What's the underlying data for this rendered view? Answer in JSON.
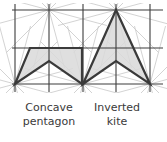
{
  "diagram": {
    "grid": {
      "vertical_x": [
        15,
        49,
        83,
        116,
        150
      ],
      "horizontal_y": [
        10,
        48,
        84
      ],
      "x_min": 12,
      "x_max": 163,
      "y_min": 4,
      "y_max": 92,
      "line_color": "#3c3c3c",
      "guide_color": "#c8c8c8"
    },
    "guide_centers": [
      [
        49,
        10
      ],
      [
        116,
        10
      ],
      [
        15,
        84
      ],
      [
        83,
        84
      ],
      [
        150,
        84
      ]
    ],
    "shapes": [
      {
        "name": "concave-pentagon",
        "points": [
          [
            15,
            84
          ],
          [
            30,
            48
          ],
          [
            82,
            48
          ],
          [
            82,
            84
          ],
          [
            49,
            61
          ]
        ],
        "fill": "#d9d9d9",
        "stroke": "#3a3a3a"
      },
      {
        "name": "inverted-kite",
        "points": [
          [
            83,
            84
          ],
          [
            116,
            10
          ],
          [
            150,
            84
          ],
          [
            116,
            61
          ]
        ],
        "fill": "#d9d9d9",
        "stroke": "#3a3a3a"
      }
    ],
    "labels": [
      {
        "line1": "Concave",
        "line2": "pentagon",
        "cx": 49
      },
      {
        "line1": "Inverted",
        "line2": "kite",
        "cx": 117
      }
    ]
  }
}
